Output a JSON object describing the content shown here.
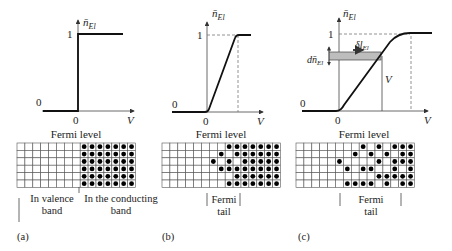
{
  "panels": [
    {
      "id": "a",
      "caption": "(a)",
      "graph": {
        "y_axis_label": "n̄",
        "y_axis_sub": "El",
        "x_axis_label": "V",
        "y_tick": "1",
        "y_zero": "0",
        "x_zero": "0",
        "curve": "step"
      },
      "grid_title": "Fermi level",
      "grid": {
        "rows": 6,
        "cols": 15,
        "dots": [
          [
            8,
            9,
            10,
            11,
            12,
            13,
            14
          ],
          [
            8,
            9,
            10,
            11,
            12,
            13,
            14
          ],
          [
            8,
            9,
            10,
            11,
            12,
            13,
            14
          ],
          [
            8,
            9,
            10,
            11,
            12,
            13,
            14
          ],
          [
            8,
            9,
            10,
            11,
            12,
            13,
            14
          ],
          [
            8,
            9,
            10,
            11,
            12,
            13,
            14
          ]
        ]
      },
      "labels": {
        "left": "In valence",
        "left2": "band",
        "right": "In the conducting",
        "right2": "band"
      }
    },
    {
      "id": "b",
      "caption": "(b)",
      "graph": {
        "y_axis_label": "n̄",
        "y_axis_sub": "El",
        "x_axis_label": "V",
        "y_tick": "1",
        "y_zero": "0",
        "x_zero": "0",
        "curve": "ramp"
      },
      "grid_title": "Fermi level",
      "grid": {
        "rows": 6,
        "cols": 15,
        "dots": [
          [
            8,
            9,
            10,
            11,
            12,
            13,
            14
          ],
          [
            7,
            9,
            10,
            11,
            12,
            13,
            14
          ],
          [
            6,
            8,
            10,
            11,
            12,
            13,
            14
          ],
          [
            7,
            8,
            9,
            10,
            11,
            12,
            13,
            14
          ],
          [
            9,
            10,
            11,
            12,
            13,
            14
          ],
          [
            8,
            9,
            10,
            11,
            12,
            13,
            14
          ]
        ]
      },
      "labels": {
        "tail1": "Fermi",
        "tail2": "tail"
      }
    },
    {
      "id": "c",
      "caption": "(c)",
      "graph": {
        "y_axis_label": "n̄",
        "y_axis_sub": "El",
        "x_axis_label": "V",
        "y_tick": "1",
        "y_zero": "0",
        "x_zero": "0",
        "curve": "smooth",
        "annotation_dn": "dn̄",
        "annotation_dn_sub": "El",
        "annotation_dl": "δl",
        "annotation_dl_sub": "El",
        "annotation_v": "V"
      },
      "grid_title": "Fermi level",
      "grid": {
        "rows": 6,
        "cols": 15,
        "dots": [
          [
            8,
            10,
            12,
            13,
            14
          ],
          [
            7,
            9,
            11,
            13,
            14
          ],
          [
            5,
            10,
            12,
            13,
            14
          ],
          [
            6,
            8,
            9,
            12,
            14
          ],
          [
            10,
            11,
            12,
            13,
            14
          ],
          [
            6,
            7,
            8,
            9,
            11,
            13,
            14
          ]
        ]
      },
      "labels": {
        "tail1": "Fermi",
        "tail2": "tail"
      }
    }
  ]
}
